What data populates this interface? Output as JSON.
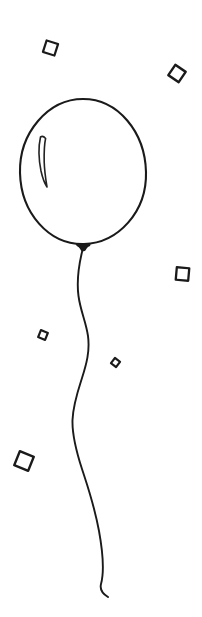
{
  "artwork": {
    "title": "Hand-drawn balloon with confetti",
    "style": "black ink line drawing, white background",
    "canvas": {
      "width": 202,
      "height": 617
    },
    "colors": {
      "background": "#ffffff",
      "ink": "#1a1a1a",
      "ink_soft": "#222222"
    }
  },
  "balloon": {
    "name": "balloon",
    "body": {
      "shape": "oval",
      "center_x": 83,
      "center_y": 172,
      "radius_x": 63,
      "radius_y": 73,
      "bounds": {
        "left": 20,
        "top": 99,
        "right": 146,
        "bottom": 244
      },
      "stroke_width": 2.1,
      "path": "M 83 99 C 118 99 145 132 146 172 C 147 212 118 243 84 244 C 49 245 21 213 20 173 C 19 133 48 99 83 99 Z"
    },
    "highlight": {
      "shape": "thin crescent reflection on upper-left of balloon",
      "stroke_width": 1.6,
      "path": "M 40.5 137 C 38.5 146 38.8 160 41 171 C 42.8 179 45 184 47 187 C 46 181 44.5 172 44.2 162 C 44 152 44.6 143 45.6 138.5 C 44 136.5 42 136 40.5 137 Z"
    },
    "knot": {
      "shape": "small dark triangular knot at bottom of balloon",
      "center_x": 83,
      "center_y": 246,
      "path": "M 76.5 243.6 C 79 243 87 243 90 243.8 C 91 244.2 90.6 246 89 246.6 C 87.5 247.2 86.6 248.6 85.6 250.2 C 84.6 251.6 82 251.8 81 250.4 C 80 249 79.4 247.4 77.6 246.6 C 76 246 75.6 244.2 76.5 243.6 Z"
    },
    "string": {
      "shape": "long wavy string hanging from the knot",
      "stroke_width": 1.9,
      "start": {
        "x": 83,
        "y": 250
      },
      "end": {
        "x": 108,
        "y": 597
      },
      "path": "M 82.5 250 C 78.5 266 76.5 281 78.5 296 C 80.5 311 86 322 88 336 C 90 351 86.5 364 82 378 C 77.5 392 73 405 72.5 420 C 72 436 76.5 452 82 469 C 87.5 486 94 504 99 531 C 103 553 104 573 101 584 C 99.5 590 103 594 108 597"
    }
  },
  "confetti": [
    {
      "name": "confetti-square-top-left",
      "center_x": 50.5,
      "center_y": 48,
      "size": 12,
      "rotation": 18,
      "stroke_width": 2.2,
      "style": "outlined rotated square"
    },
    {
      "name": "confetti-square-top-right",
      "center_x": 177,
      "center_y": 73.5,
      "size": 12.5,
      "rotation": 34,
      "stroke_width": 2.4,
      "style": "outlined rotated square"
    },
    {
      "name": "confetti-square-mid-right",
      "center_x": 182.5,
      "center_y": 274,
      "size": 12.5,
      "rotation": 5,
      "stroke_width": 2.3,
      "style": "outlined square nearly axis aligned"
    },
    {
      "name": "confetti-square-mid-left-small",
      "center_x": 43,
      "center_y": 335,
      "size": 7.5,
      "rotation": 22,
      "stroke_width": 2.2,
      "style": "small outlined rotated square"
    },
    {
      "name": "confetti-square-near-string-tiny",
      "center_x": 115.5,
      "center_y": 362.5,
      "size": 6.5,
      "rotation": 38,
      "stroke_width": 2.1,
      "style": "tiny outlined rotated square"
    },
    {
      "name": "confetti-square-lower-left-large",
      "center_x": 24,
      "center_y": 461,
      "size": 15,
      "rotation": 22,
      "stroke_width": 2.4,
      "style": "large outlined rotated square"
    }
  ]
}
